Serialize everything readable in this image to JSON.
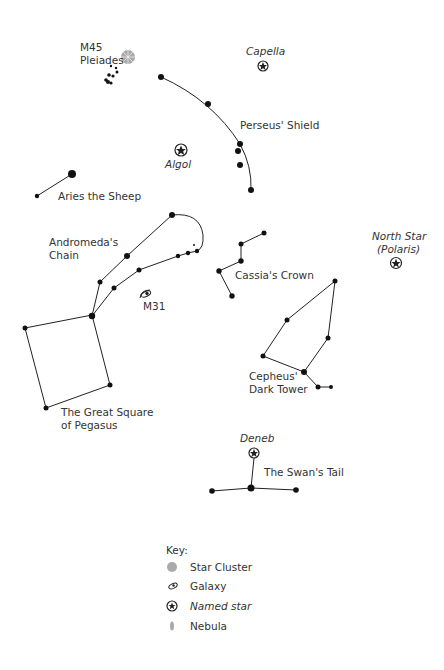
{
  "labels": {
    "m45": "M45",
    "pleiades": "Pleiades",
    "capella": "Capella",
    "perseus": "Perseus' Shield",
    "algol": "Algol",
    "aries": "Aries the Sheep",
    "andromeda1": "Andromeda's",
    "andromeda2": "Chain",
    "north1": "North Star",
    "north2": "(Polaris)",
    "cassia": "Cassia's Crown",
    "m31": "M31",
    "cepheus1": "Cepheus'",
    "cepheus2": "Dark Tower",
    "square1": "The Great Square",
    "square2": "of Pegasus",
    "deneb": "Deneb",
    "swan": "The Swan's Tail"
  },
  "key": {
    "title": "Key:",
    "items": [
      {
        "icon": "star-cluster-icon",
        "label": "Star Cluster"
      },
      {
        "icon": "galaxy-icon",
        "label": "Galaxy"
      },
      {
        "icon": "named-star-icon",
        "label": "Named star"
      },
      {
        "icon": "nebula-icon",
        "label": "Nebula"
      }
    ]
  },
  "colors": {
    "line": "#222222",
    "text": "#333333",
    "cluster": "#999999"
  }
}
